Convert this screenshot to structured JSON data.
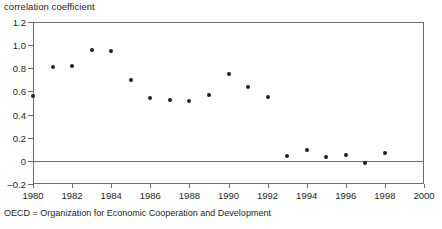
{
  "figure": {
    "y_axis_title": "correlation coefficient",
    "footnote": "OECD = Organization for Economic Cooperation and Development"
  },
  "chart_data": {
    "type": "scatter",
    "title": "",
    "subtitle": "",
    "xlabel": "",
    "ylabel": "correlation coefficient",
    "xlim": [
      1980,
      2000
    ],
    "ylim": [
      -0.2,
      1.2
    ],
    "grid": false,
    "legend": null,
    "zero_line": 0,
    "xticks": [
      1980,
      1982,
      1984,
      1986,
      1988,
      1990,
      1992,
      1994,
      1996,
      1998,
      2000
    ],
    "xtick_labels": [
      "1980",
      "1982",
      "1984",
      "1986",
      "1988",
      "1990",
      "1992",
      "1994",
      "1996",
      "1998",
      "2000"
    ],
    "yticks": [
      -0.2,
      0,
      0.2,
      0.4,
      0.6,
      0.8,
      1.0,
      1.2
    ],
    "ytick_labels": [
      "-0.2",
      "0",
      "0.2",
      "0.4",
      "0.6",
      "0.8",
      "1.0",
      "1.2"
    ],
    "marker_color": "#231f20",
    "axis_color": "#6d6e71",
    "x": [
      1980,
      1981,
      1982,
      1983,
      1984,
      1985,
      1986,
      1987,
      1988,
      1989,
      1990,
      1991,
      1992,
      1993,
      1994,
      1995,
      1996,
      1997,
      1998
    ],
    "values": [
      0.56,
      0.81,
      0.82,
      0.96,
      0.95,
      0.7,
      0.54,
      0.53,
      0.52,
      0.57,
      0.75,
      0.64,
      0.55,
      0.04,
      0.09,
      0.03,
      0.05,
      -0.02,
      0.07
    ],
    "annotations": [
      "OECD = Organization for Economic Cooperation and Development"
    ]
  }
}
